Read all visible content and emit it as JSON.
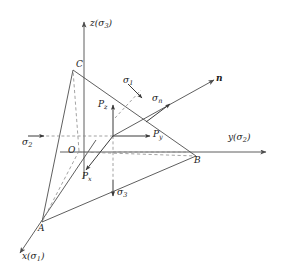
{
  "figure": {
    "stroke_color": "#4d4d4d",
    "dash_color": "#8c8c8c",
    "text_color": "#1a1a1a",
    "background": "#ffffff"
  },
  "axes": [
    {
      "id": "z",
      "label_main": "z",
      "label_paren_open": "(",
      "label_sym": "σ",
      "label_sub": "3",
      "label_paren_close": ")"
    },
    {
      "id": "y",
      "label_main": "y",
      "label_paren_open": "(",
      "label_sym": "σ",
      "label_sub": "2",
      "label_paren_close": ")"
    },
    {
      "id": "x",
      "label_main": "x",
      "label_paren_open": "(",
      "label_sym": "σ",
      "label_sub": "1",
      "label_paren_close": ")"
    }
  ],
  "vertices": [
    {
      "id": "O",
      "label": "O"
    },
    {
      "id": "A",
      "label": "A"
    },
    {
      "id": "B",
      "label": "B"
    },
    {
      "id": "C",
      "label": "C"
    }
  ],
  "stresses": [
    {
      "id": "sigma1",
      "sym": "σ",
      "sub": "1"
    },
    {
      "id": "sigma2",
      "sym": "σ",
      "sub": "2"
    },
    {
      "id": "sigma3",
      "sym": "σ",
      "sub": "3"
    },
    {
      "id": "sigman",
      "sym": "σ",
      "sub": "n"
    }
  ],
  "traction_components": [
    {
      "id": "Px",
      "sym": "P",
      "sub": "x"
    },
    {
      "id": "Py",
      "sym": "P",
      "sub": "y"
    },
    {
      "id": "Pz",
      "sym": "P",
      "sub": "z"
    }
  ],
  "normal": {
    "id": "n",
    "label": "n"
  }
}
